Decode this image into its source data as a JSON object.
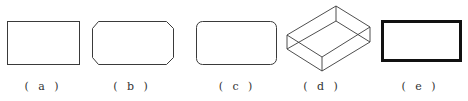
{
  "figure": {
    "stroke_color": "#3a3a3a",
    "panels": [
      {
        "id": "a",
        "label": "( a )",
        "shape": "rectangle",
        "label_x": 43
      },
      {
        "id": "b",
        "label": "( b )",
        "shape": "chamfered-rectangle",
        "label_x": 132
      },
      {
        "id": "c",
        "label": "( c )",
        "shape": "rounded-rectangle",
        "label_x": 237
      },
      {
        "id": "d",
        "label": "( d )",
        "shape": "isometric-box",
        "label_x": 322
      },
      {
        "id": "e",
        "label": "( e )",
        "shape": "thick-border-rectangle",
        "label_x": 420
      }
    ]
  }
}
